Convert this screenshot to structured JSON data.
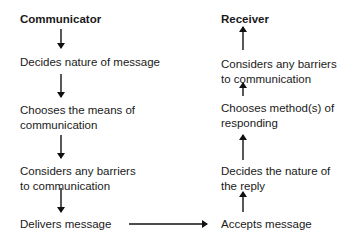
{
  "communicator": {
    "title": "Communicator",
    "steps": [
      {
        "line1": "Decides nature of message",
        "line2": ""
      },
      {
        "line1": "Chooses the means of",
        "line2": "communication"
      },
      {
        "line1": "Considers any barriers",
        "line2": "to communication"
      },
      {
        "line1": "Delivers message",
        "line2": ""
      }
    ]
  },
  "receiver": {
    "title": "Receiver",
    "steps": [
      {
        "line1": "Considers any barriers",
        "line2": "to communication"
      },
      {
        "line1": "Chooses method(s) of",
        "line2": "responding"
      },
      {
        "line1": "Decides the nature of",
        "line2": "the reply"
      },
      {
        "line1": "Accepts message",
        "line2": ""
      }
    ]
  },
  "colors": {
    "text": "#1a1a1a",
    "arrow": "#111111",
    "background": "#ffffff"
  }
}
